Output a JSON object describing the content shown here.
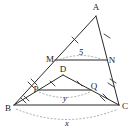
{
  "figure": {
    "background_color": "#ffffff",
    "line_color": "#2b2b2b",
    "arc_color": "#8a8a8a",
    "label_color": "#1a1a1a"
  },
  "vertices": {
    "A": {
      "label": "A",
      "x": 99,
      "y": 11
    },
    "B": {
      "label": "B",
      "x": 14,
      "y": 108
    },
    "C": {
      "label": "C",
      "x": 120,
      "y": 108
    },
    "M": {
      "label": "M",
      "x": 57,
      "y": 59
    },
    "N": {
      "label": "N",
      "x": 110,
      "y": 59
    },
    "D": {
      "label": "D",
      "x": 64,
      "y": 74
    },
    "P": {
      "label": "P",
      "x": 39,
      "y": 89
    },
    "Q": {
      "label": "Q",
      "x": 92,
      "y": 89
    }
  },
  "segments": [
    {
      "name": "A-B",
      "from": "A",
      "to": "B"
    },
    {
      "name": "A-C",
      "from": "A",
      "to": "C"
    },
    {
      "name": "B-C",
      "from": "B",
      "to": "C"
    },
    {
      "name": "M-N",
      "from": "M",
      "to": "N"
    },
    {
      "name": "D-B",
      "from": "D",
      "to": "B"
    },
    {
      "name": "D-C",
      "from": "D",
      "to": "C"
    },
    {
      "name": "P-Q",
      "from": "P",
      "to": "Q"
    }
  ],
  "tick_marks": [
    {
      "name": "tick-AM",
      "segment": "A-M",
      "count": 1
    },
    {
      "name": "tick-MB",
      "segment": "M-B",
      "count": 2
    },
    {
      "name": "tick-AN",
      "segment": "A-N",
      "count": 1
    },
    {
      "name": "tick-NC",
      "segment": "N-C",
      "count": 2
    },
    {
      "name": "tick-DP",
      "segment": "D-P",
      "count": 1
    },
    {
      "name": "tick-PB",
      "segment": "P-B",
      "count": 2
    },
    {
      "name": "tick-DQ",
      "segment": "D-Q",
      "count": 1
    },
    {
      "name": "tick-QC",
      "segment": "Q-C",
      "count": 2
    }
  ],
  "measures": [
    {
      "name": "measure-mn",
      "label": "5",
      "spans": "M-N",
      "italic": false
    },
    {
      "name": "measure-pq",
      "label": "y",
      "spans": "P-Q",
      "italic": true
    },
    {
      "name": "measure-bc",
      "label": "x",
      "spans": "B-C",
      "italic": true
    }
  ]
}
